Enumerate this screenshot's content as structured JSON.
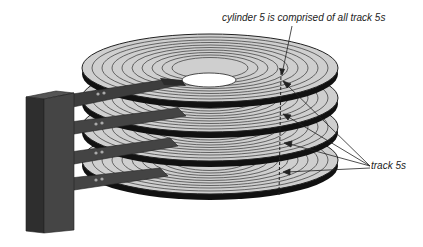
{
  "diagram": {
    "labels": {
      "cylinder": "cylinder 5 is comprised of all track 5s",
      "tracks": "track 5s"
    },
    "platters": [
      {
        "name": "platter-1",
        "cy": 68
      },
      {
        "name": "platter-2",
        "cy": 98
      },
      {
        "name": "platter-3",
        "cy": 127
      },
      {
        "name": "platter-4",
        "cy": 160
      }
    ],
    "colors": {
      "platter_fill": "#cfcfcf",
      "track_line": "#333333",
      "actuator": "#3a3a3a",
      "arm": "#444444",
      "background": "#ffffff"
    },
    "track_count": 10,
    "highlighted_track": 5
  }
}
